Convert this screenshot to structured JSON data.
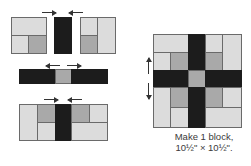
{
  "diagram": {
    "type": "quilt-block-assembly",
    "caption": {
      "line1": "Make 1 block,",
      "line2": "10½\" × 10½\"."
    },
    "colors": {
      "light": "#dcdcdc",
      "medium": "#a9a9a9",
      "dark": "#1c1c1c",
      "outline": "#6a6a6a",
      "arrow": "#333333"
    },
    "rows": [
      {
        "name": "top-row",
        "units": [
          "corner-unit-left",
          "dark-strip",
          "corner-unit-right"
        ],
        "pressing_arrows": [
          "toward-center",
          "toward-center"
        ]
      },
      {
        "name": "middle-row",
        "units": [
          "dark-strip",
          "medium-square",
          "dark-strip"
        ],
        "pressing_arrows": [
          "away-from-center",
          "away-from-center"
        ]
      },
      {
        "name": "bottom-row",
        "units": [
          "corner-unit-left",
          "dark-strip",
          "corner-unit-right"
        ],
        "pressing_arrows": [
          "toward-center",
          "toward-center"
        ]
      }
    ],
    "finished_block": {
      "pressing_arrows": [
        "up",
        "down"
      ]
    }
  }
}
